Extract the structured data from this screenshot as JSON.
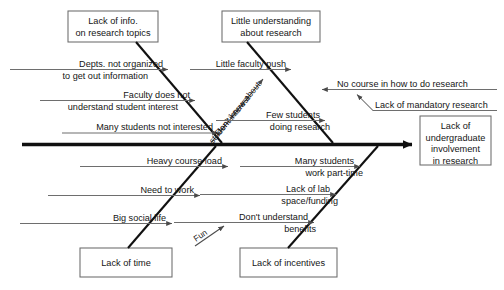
{
  "diagram": {
    "type": "fishbone-ishikawa",
    "title_visible": false,
    "colors": {
      "background": "#ffffff",
      "spine": "#101010",
      "bone": "#111111",
      "sub_line": "#6e6e6e",
      "box_border": "#6b6b6b",
      "text": "#151515"
    },
    "effect": {
      "label_line1": "Lack of",
      "label_line2": "undergraduate",
      "label_line3": "involvement",
      "label_line4": "in research"
    },
    "categories": [
      {
        "id": "lack-of-info",
        "position": "top-left",
        "label_line1": "Lack of info.",
        "label_line2": "on research topics"
      },
      {
        "id": "little-understanding",
        "position": "top-right",
        "label_line1": "Little understanding",
        "label_line2": "about research"
      },
      {
        "id": "lack-of-time",
        "position": "bottom-left",
        "label_line1": "Lack of time",
        "label_line2": ""
      },
      {
        "id": "lack-of-incentives",
        "position": "bottom-left-center",
        "label_line1": "Lack of incentives",
        "label_line2": ""
      }
    ],
    "causes": [
      {
        "id": "depts-not-organized",
        "parent": "lack-of-info",
        "line1": "Depts. not organized",
        "line2": "to get out information"
      },
      {
        "id": "faculty-does-not-understand",
        "parent": "lack-of-info",
        "line1": "Faculty does not",
        "line2": "understand student interest"
      },
      {
        "id": "many-students-not-interested",
        "parent": "lack-of-info",
        "line1": "Many students not interested",
        "line2": ""
      },
      {
        "id": "little-faculty-push",
        "parent": "little-understanding",
        "line1": "Little faculty push",
        "line2": ""
      },
      {
        "id": "no-course-in-how-to-do-research",
        "parent": "little-understanding",
        "line1": "No course in how to do research",
        "line2": ""
      },
      {
        "id": "lack-of-mandatory-research",
        "parent": "little-understanding",
        "line1": "Lack of mandatory research",
        "line2": ""
      },
      {
        "id": "few-students-doing-research",
        "parent": "little-understanding",
        "line1": "Few students",
        "line2": "doing research"
      },
      {
        "id": "dont-know-about-student-interest",
        "parent": "lack-of-info",
        "line1": "Don't know about",
        "line2": "student interest",
        "orientation": "diagonal"
      },
      {
        "id": "heavy-course-load",
        "parent": "lack-of-time",
        "line1": "Heavy course load",
        "line2": ""
      },
      {
        "id": "need-to-work",
        "parent": "lack-of-time",
        "line1": "Need to work",
        "line2": ""
      },
      {
        "id": "big-social-life",
        "parent": "lack-of-time",
        "line1": "Big social life",
        "line2": ""
      },
      {
        "id": "fun",
        "parent": "lack-of-time",
        "line1": "Fun",
        "line2": "",
        "orientation": "diagonal"
      },
      {
        "id": "many-students-work-part-time",
        "parent": "lack-of-incentives",
        "line1": "Many students",
        "line2": "work part-time"
      },
      {
        "id": "lack-of-lab-space-funding",
        "parent": "lack-of-incentives",
        "line1": "Lack of lab",
        "line2": "space/funding"
      },
      {
        "id": "dont-understand-benefits",
        "parent": "lack-of-incentives",
        "line1": "Don't understand",
        "line2": "benefits"
      }
    ]
  }
}
